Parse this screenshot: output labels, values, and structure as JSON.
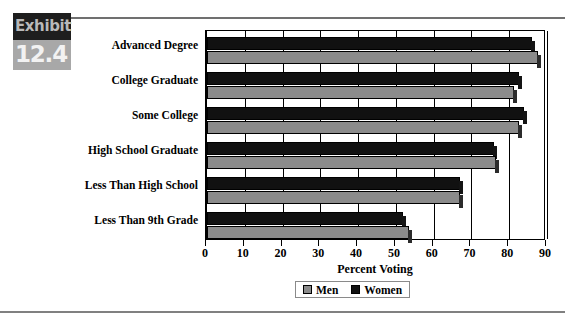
{
  "exhibit": {
    "label": "Exhibit",
    "number": "12.4"
  },
  "legend": {
    "position": "bottom-center",
    "items": [
      {
        "name": "Men",
        "color": "#8b8b8b",
        "swatch": "men-swatch"
      },
      {
        "name": "Women",
        "color": "#111111",
        "swatch": "women-swatch"
      }
    ]
  },
  "chart_data": {
    "type": "bar",
    "orientation": "horizontal",
    "title": "",
    "subtitle": "",
    "xlabel": "Percent Voting",
    "ylabel": "",
    "xlim": [
      0,
      90
    ],
    "xticks": [
      0,
      10,
      20,
      30,
      40,
      50,
      60,
      70,
      80,
      90
    ],
    "xtick_labels": [
      "0",
      "10",
      "20",
      "30",
      "40",
      "50",
      "60",
      "70",
      "80",
      "90"
    ],
    "grid": true,
    "grid_axis": "x",
    "legend_position": "bottom-center",
    "categories": [
      "Advanced Degree",
      "College Graduate",
      "Some College",
      "High School Graduate",
      "Less Than High School",
      "Less Than 9th Grade"
    ],
    "series": [
      {
        "name": "Men",
        "color": "#8b8b8b",
        "values": [
          87.5,
          81.3,
          82.5,
          76.5,
          67.0,
          53.5
        ]
      },
      {
        "name": "Women",
        "color": "#111111",
        "values": [
          86.0,
          82.6,
          84.0,
          76.0,
          67.0,
          52.0
        ]
      }
    ]
  }
}
